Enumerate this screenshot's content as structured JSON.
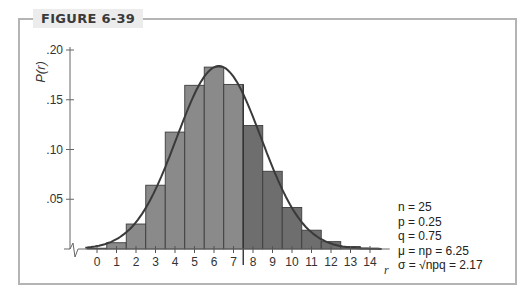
{
  "figure": {
    "label": "FIGURE 6-39"
  },
  "params": {
    "n": "n = 25",
    "p": "p = 0.25",
    "q": "q = 0.75",
    "mu": "μ = np = 6.25",
    "sigma": "σ = √npq = 2.17"
  },
  "chart_data": {
    "type": "bar",
    "title": "FIGURE 6-39",
    "xlabel": "r",
    "ylabel": "P(r)",
    "categories": [
      "0",
      "1",
      "2",
      "3",
      "4",
      "5",
      "6",
      "7",
      "8",
      "9",
      "10",
      "11",
      "12",
      "13",
      "14"
    ],
    "values": [
      0.0008,
      0.0063,
      0.0251,
      0.0641,
      0.1175,
      0.1645,
      0.1828,
      0.1654,
      0.1241,
      0.0781,
      0.0417,
      0.0189,
      0.0074,
      0.0025,
      0.0007
    ],
    "ylim": [
      0,
      0.2
    ],
    "yticks": [
      ".05",
      ".10",
      ".15",
      ".20"
    ],
    "overlay": "normal curve, mu = 6.25, sigma = 2.17",
    "divider_at": 7.5,
    "colors": {
      "bar_left": "#8a8a8a",
      "bar_right": "#6e6e6e",
      "curve": "#3a3a3a",
      "gap_fill": "#b8b8b8"
    },
    "annotations": [
      "n = 25",
      "p = 0.25",
      "q = 0.75",
      "μ = np = 6.25",
      "σ = √npq = 2.17"
    ],
    "grid": false,
    "legend": "none"
  }
}
